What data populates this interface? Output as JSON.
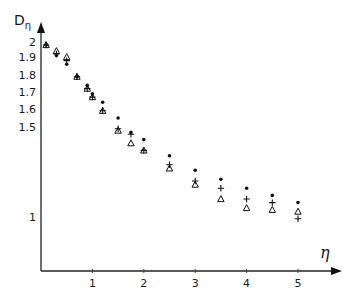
{
  "chart_data": {
    "type": "scatter",
    "title": "",
    "xlabel": "η",
    "ylabel": "Dη",
    "xlim": [
      0,
      5.6
    ],
    "ylim": [
      0.8,
      2.05
    ],
    "grid": false,
    "legend": null,
    "x_ticks": [
      "1",
      "2",
      "3",
      "4",
      "5"
    ],
    "y_ticks": [
      "1",
      "1.5",
      "1.6",
      "1.7",
      "1.8",
      "1.9",
      "2"
    ],
    "x": [
      0.1,
      0.3,
      0.5,
      0.7,
      0.9,
      1.0,
      1.2,
      1.5,
      1.75,
      2.0,
      2.5,
      3.0,
      3.5,
      4.0,
      4.5,
      5.0
    ],
    "series": [
      {
        "name": "dot",
        "marker": "•",
        "values": [
          1.98,
          1.91,
          1.86,
          1.79,
          1.74,
          1.69,
          1.64,
          1.55,
          1.47,
          1.43,
          1.34,
          1.26,
          1.21,
          1.16,
          1.12,
          1.08
        ]
      },
      {
        "name": "plus",
        "marker": "+",
        "values": [
          1.98,
          1.92,
          1.88,
          1.79,
          1.72,
          1.67,
          1.59,
          1.49,
          1.46,
          1.37,
          1.29,
          1.2,
          1.16,
          1.1,
          1.08,
          0.99
        ]
      },
      {
        "name": "triangle",
        "marker": "△",
        "values": [
          1.98,
          1.94,
          1.9,
          1.79,
          1.72,
          1.67,
          1.59,
          1.48,
          1.41,
          1.37,
          1.27,
          1.18,
          1.1,
          1.05,
          1.04,
          1.03
        ]
      }
    ]
  },
  "axes": {
    "x_title": "η",
    "y_title_main": "D",
    "y_title_sub": "η"
  }
}
